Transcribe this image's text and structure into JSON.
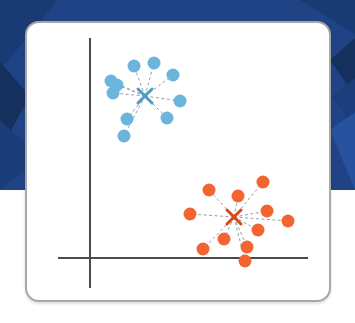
{
  "slide": {
    "background_color": "#1F4385",
    "background_accent_dark": "#16305E",
    "background_accent_light": "#27529E",
    "page_background": "#ffffff"
  },
  "card": {
    "border_color": "#a7a7a7",
    "fill_color": "#ffffff",
    "corner_radius": 14
  },
  "chart_data": {
    "type": "scatter",
    "title": "",
    "subtitle": "",
    "xlabel": "",
    "ylabel": "",
    "grid": false,
    "legend_position": "none",
    "axes": {
      "x_axis": {
        "x1": 31,
        "y1": 235,
        "x2": 281,
        "y2": 235,
        "color": "#4a4a4a",
        "width": 2
      },
      "y_axis": {
        "x1": 63,
        "y1": 15,
        "x2": 63,
        "y2": 265,
        "color": "#4a4a4a",
        "width": 2
      },
      "xlim": [
        0,
        306
      ],
      "ylim": [
        0,
        281
      ]
    },
    "style": {
      "point_radius": 6.5,
      "centroid_marker": "x",
      "spoke_style": "dashed",
      "spoke_color": "#9aa0a6",
      "spoke_width": 1
    },
    "series": [
      {
        "name": "Cluster 1",
        "color": "#6BB5DC",
        "centroid": {
          "x": 118,
          "y": 73
        },
        "centroid_color": "#4F9CC6",
        "points": [
          {
            "x": 107,
            "y": 43
          },
          {
            "x": 127,
            "y": 40
          },
          {
            "x": 146,
            "y": 52
          },
          {
            "x": 153,
            "y": 78
          },
          {
            "x": 140,
            "y": 95
          },
          {
            "x": 100,
            "y": 96
          },
          {
            "x": 97,
            "y": 113
          },
          {
            "x": 90,
            "y": 62
          },
          {
            "x": 84,
            "y": 58
          },
          {
            "x": 86,
            "y": 70
          }
        ]
      },
      {
        "name": "Cluster 2",
        "color": "#F26430",
        "centroid": {
          "x": 207,
          "y": 194
        },
        "centroid_color": "#D9481C",
        "points": [
          {
            "x": 182,
            "y": 167
          },
          {
            "x": 211,
            "y": 173
          },
          {
            "x": 236,
            "y": 159
          },
          {
            "x": 240,
            "y": 188
          },
          {
            "x": 261,
            "y": 198
          },
          {
            "x": 231,
            "y": 207
          },
          {
            "x": 220,
            "y": 224
          },
          {
            "x": 197,
            "y": 216
          },
          {
            "x": 176,
            "y": 226
          },
          {
            "x": 218,
            "y": 238
          },
          {
            "x": 163,
            "y": 191
          }
        ]
      }
    ]
  },
  "background_shapes": [
    {
      "name": "panel-top",
      "points": "0,0 355,0 355,190 0,190",
      "fill": "#1F4385"
    },
    {
      "name": "facet-top-left-dark",
      "points": "0,0 58,0 0,70",
      "fill": "#1A3A74"
    },
    {
      "name": "facet-left-mid",
      "points": "0,62 30,96 0,150",
      "fill": "#16305E"
    },
    {
      "name": "facet-left-lower",
      "points": "0,120 40,158 0,190",
      "fill": "#1B3C79"
    },
    {
      "name": "facet-right-upper",
      "points": "330,60 355,38 355,96",
      "fill": "#16305E"
    },
    {
      "name": "facet-right-mid",
      "points": "332,96 355,78 355,130",
      "fill": "#1C3E7C"
    },
    {
      "name": "facet-right-lower",
      "points": "330,130 355,112 355,190",
      "fill": "#27529E"
    },
    {
      "name": "facet-top-right",
      "points": "300,0 355,0 355,34",
      "fill": "#1A3A74"
    }
  ],
  "accessibility": {
    "figure_description": "Scatter plot on a white rounded card showing two clusters of dots: a blue cluster in the upper left and an orange cluster in the lower right, each with dashed spokes radiating from an X centroid marker."
  }
}
